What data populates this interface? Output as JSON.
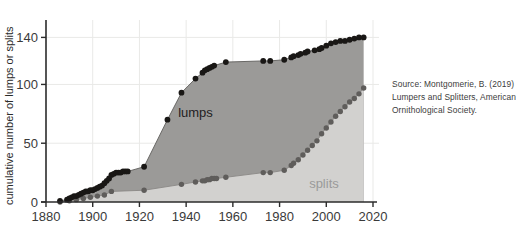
{
  "figure": {
    "source_note": "Source: Montgomerie, B. (2019) Lumpers and Splitters, American Ornithological Society.",
    "background_color": "#ffffff"
  },
  "chart_data": {
    "type": "area",
    "title": "",
    "xlabel": "",
    "ylabel": "cumulative number of lumps or splits",
    "xlim": [
      1880,
      2020
    ],
    "ylim": [
      0,
      148
    ],
    "xticks": [
      1880,
      1900,
      1920,
      1940,
      1960,
      1980,
      2000,
      2020
    ],
    "yticks": [
      0,
      50,
      100,
      140
    ],
    "grid": true,
    "legend": "inline-annotations",
    "annotations": [
      {
        "text": "lumps",
        "x": 1944,
        "y": 72,
        "color": "#23211f"
      },
      {
        "text": "splits",
        "x": 1999,
        "y": 12,
        "color": "#9a9a9a"
      }
    ],
    "colors": {
      "lumps_marker": "#191715",
      "lumps_fill": "#9b9a98",
      "lumps_line": "#5e5c5a",
      "splits_marker": "#5f5d5b",
      "splits_fill": "#d2d1cf",
      "splits_line": "#8a8886",
      "axis": "#2b2b2b",
      "grid": "#e9e9e7"
    },
    "series": [
      {
        "name": "lumps",
        "x": [
          1886,
          1889,
          1890,
          1891,
          1892,
          1893,
          1894,
          1895,
          1896,
          1897,
          1898,
          1899,
          1900,
          1901,
          1902,
          1903,
          1904,
          1905,
          1906,
          1907,
          1908,
          1909,
          1910,
          1911,
          1912,
          1913,
          1914,
          1915,
          1922,
          1932,
          1938,
          1944,
          1947,
          1948,
          1949,
          1950,
          1951,
          1952,
          1957,
          1973,
          1976,
          1982,
          1985,
          1986,
          1988,
          1989,
          1991,
          1992,
          1995,
          1997,
          1998,
          2000,
          2002,
          2004,
          2006,
          2008,
          2010,
          2012,
          2014,
          2016
        ],
        "values": [
          1,
          2,
          3,
          4,
          5,
          5,
          6,
          7,
          8,
          9,
          9,
          10,
          10,
          11,
          12,
          13,
          14,
          16,
          18,
          20,
          23,
          24,
          25,
          25,
          25,
          26,
          26,
          26,
          30,
          70,
          93,
          105,
          110,
          112,
          113,
          114,
          115,
          116,
          119,
          120,
          120,
          121,
          123,
          124,
          125,
          126,
          127,
          128,
          129,
          130,
          131,
          133,
          135,
          136,
          137,
          137,
          138,
          139,
          140,
          140
        ]
      },
      {
        "name": "splits",
        "x": [
          1886,
          1890,
          1893,
          1896,
          1899,
          1902,
          1905,
          1908,
          1922,
          1938,
          1944,
          1947,
          1948,
          1949,
          1950,
          1951,
          1952,
          1953,
          1957,
          1973,
          1976,
          1982,
          1985,
          1986,
          1988,
          1990,
          1992,
          1994,
          1996,
          1998,
          2000,
          2002,
          2004,
          2006,
          2008,
          2010,
          2012,
          2014,
          2016
        ],
        "values": [
          0,
          1,
          2,
          3,
          4,
          5,
          6,
          9,
          10,
          15,
          17,
          18,
          18,
          19,
          19,
          20,
          20,
          20,
          21,
          25,
          25,
          27,
          31,
          33,
          36,
          40,
          44,
          48,
          52,
          58,
          63,
          68,
          73,
          77,
          81,
          85,
          88,
          92,
          97
        ]
      }
    ]
  }
}
